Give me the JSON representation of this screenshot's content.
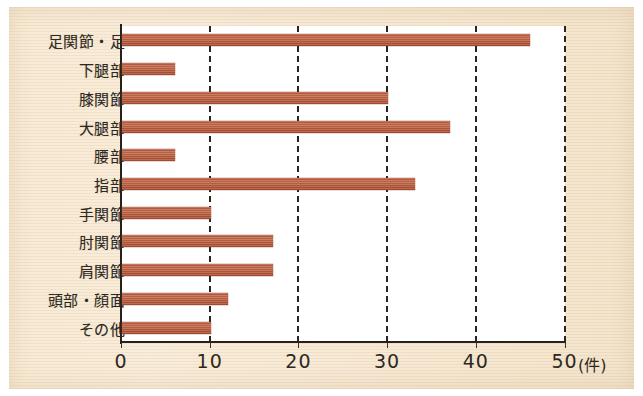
{
  "chart_data": {
    "type": "bar",
    "orientation": "horizontal",
    "title": "",
    "xlabel": "(件)",
    "ylabel": "",
    "xlim": [
      0,
      50
    ],
    "xticks": [
      0,
      10,
      20,
      30,
      40,
      50
    ],
    "xtick_labels": [
      "0",
      "10",
      "20",
      "30",
      "40",
      "50"
    ],
    "unit": "(件)",
    "grid": "vertical-dashed",
    "legend": "none",
    "bar_color": "#b85a3c",
    "background_color": "#f6e7d0",
    "plot_background_color": "#ffffff",
    "axis_color": "#26211c",
    "categories": [
      "足関節・足",
      "下腿部",
      "膝関節",
      "大腿部",
      "腰部",
      "指部",
      "手関節",
      "肘関節",
      "肩関節",
      "頭部・顔面",
      "その他"
    ],
    "values": [
      46,
      6,
      30,
      37,
      6,
      33,
      10,
      17,
      17,
      12,
      10
    ]
  }
}
